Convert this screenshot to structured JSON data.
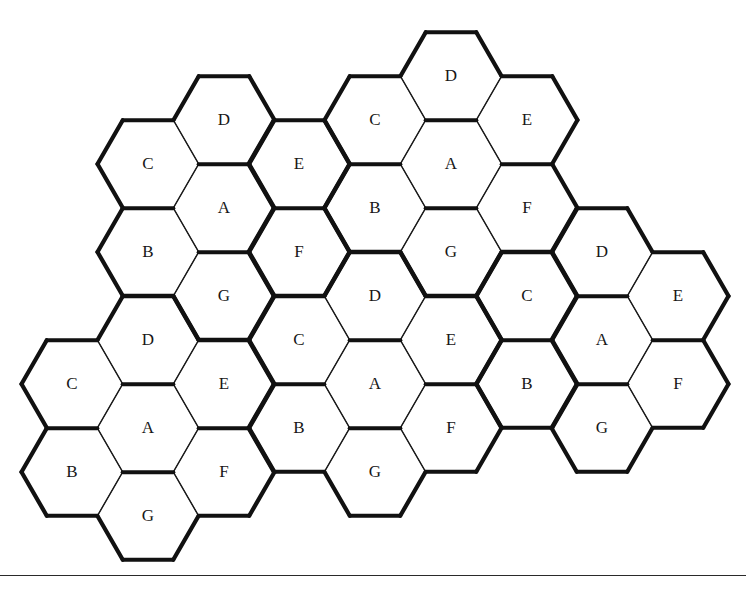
{
  "figure": {
    "kind": "hexagonal-tiling",
    "background_color": "#ffffff",
    "line_color": "#1a1a1a",
    "bold_line_color": "#111111",
    "label_color": "#171717"
  },
  "geometry": {
    "hex_radius": 50.5,
    "hex_width": 101,
    "hex_height": 87.5,
    "column_spacing": 75.7,
    "row_spacing": 87.5,
    "column_x": [
      72,
      148,
      224,
      299,
      375,
      451,
      527,
      602,
      678
    ],
    "orientation": "flat-top"
  },
  "chart_data": {
    "type": "diagram",
    "title": "",
    "clusters": [
      {
        "id": "rosette-1",
        "center_label": "A",
        "center": {
          "col": 2,
          "y": 208
        },
        "cells": [
          {
            "label": "D",
            "col": 2,
            "y": 120
          },
          {
            "label": "C",
            "col": 1,
            "y": 164
          },
          {
            "label": "E",
            "col": 3,
            "y": 164
          },
          {
            "label": "A",
            "col": 2,
            "y": 208
          },
          {
            "label": "B",
            "col": 1,
            "y": 252
          },
          {
            "label": "F",
            "col": 3,
            "y": 252
          },
          {
            "label": "G",
            "col": 2,
            "y": 296
          }
        ]
      },
      {
        "id": "rosette-2",
        "center_label": "A",
        "center": {
          "col": 5,
          "y": 164
        },
        "cells": [
          {
            "label": "D",
            "col": 5,
            "y": 76
          },
          {
            "label": "C",
            "col": 4,
            "y": 120
          },
          {
            "label": "E",
            "col": 6,
            "y": 120
          },
          {
            "label": "A",
            "col": 5,
            "y": 164
          },
          {
            "label": "B",
            "col": 4,
            "y": 208
          },
          {
            "label": "F",
            "col": 6,
            "y": 208
          },
          {
            "label": "G",
            "col": 5,
            "y": 252
          }
        ]
      },
      {
        "id": "rosette-3",
        "center_label": "A",
        "center": {
          "col": 7,
          "y": 340
        },
        "cells": [
          {
            "label": "D",
            "col": 7,
            "y": 252
          },
          {
            "label": "C",
            "col": 6,
            "y": 296
          },
          {
            "label": "E",
            "col": 8,
            "y": 296
          },
          {
            "label": "A",
            "col": 7,
            "y": 340
          },
          {
            "label": "B",
            "col": 6,
            "y": 384
          },
          {
            "label": "F",
            "col": 8,
            "y": 384
          },
          {
            "label": "G",
            "col": 7,
            "y": 428
          }
        ]
      },
      {
        "id": "rosette-4",
        "center_label": "A",
        "center": {
          "col": 4,
          "y": 384
        },
        "cells": [
          {
            "label": "D",
            "col": 4,
            "y": 296
          },
          {
            "label": "C",
            "col": 3,
            "y": 340
          },
          {
            "label": "E",
            "col": 5,
            "y": 340
          },
          {
            "label": "A",
            "col": 4,
            "y": 384
          },
          {
            "label": "B",
            "col": 3,
            "y": 428
          },
          {
            "label": "F",
            "col": 5,
            "y": 428
          },
          {
            "label": "G",
            "col": 4,
            "y": 472
          }
        ]
      },
      {
        "id": "rosette-5",
        "center_label": "A",
        "center": {
          "col": 1,
          "y": 428
        },
        "cells": [
          {
            "label": "D",
            "col": 1,
            "y": 340
          },
          {
            "label": "C",
            "col": 0,
            "y": 384
          },
          {
            "label": "E",
            "col": 2,
            "y": 384
          },
          {
            "label": "A",
            "col": 1,
            "y": 428
          },
          {
            "label": "B",
            "col": 0,
            "y": 472
          },
          {
            "label": "F",
            "col": 2,
            "y": 472
          },
          {
            "label": "G",
            "col": 1,
            "y": 516
          }
        ]
      }
    ],
    "cell_labels": [
      "A",
      "B",
      "C",
      "D",
      "E",
      "F",
      "G"
    ],
    "cell_count": 35,
    "cluster_count": 5
  },
  "footer": {
    "rule_y": 575,
    "visible": true
  }
}
